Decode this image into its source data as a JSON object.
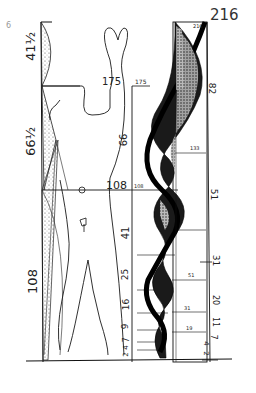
{
  "page": {
    "page_number": "216",
    "corner_mark": "6"
  },
  "figure": {
    "left_scale": {
      "labels": [
        "41½",
        "66½",
        "108"
      ]
    },
    "body_labels": {
      "height_label": "175",
      "navel_label": "108",
      "center_mark": "o"
    },
    "middle_scale": {
      "top_label": "175",
      "mid_label": "108",
      "labels": [
        "66",
        "41",
        "25",
        "16",
        "9",
        "7",
        "4",
        "2"
      ]
    },
    "right_scale": {
      "top_label": "216",
      "labels": [
        "82",
        "51",
        "31",
        "20",
        "11",
        "7",
        "4",
        "2"
      ]
    },
    "spiral_ticks": [
      "133",
      "82",
      "51",
      "31",
      "19",
      "12",
      "7"
    ]
  },
  "colors": {
    "ink": "#1a1a1a",
    "paper": "#ffffff",
    "stipple": "#6b6b6b"
  }
}
